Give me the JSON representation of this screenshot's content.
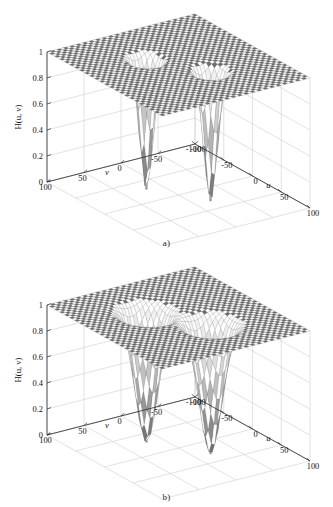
{
  "figure": {
    "panels": [
      {
        "id": "a",
        "caption": "a)",
        "zlabel": "H(u, v)",
        "xlabel": "u",
        "ylabel": "v",
        "z_ticks": [
          "0",
          "0.2",
          "0.4",
          "0.6",
          "0.8",
          "1"
        ],
        "u_ticks": [
          "-100",
          "-50",
          "0",
          "50",
          "100"
        ],
        "v_ticks": [
          "100",
          "50",
          "0",
          "-50",
          "-100"
        ]
      },
      {
        "id": "b",
        "caption": "b)",
        "zlabel": "H(u, v)",
        "xlabel": "u",
        "ylabel": "v",
        "z_ticks": [
          "0",
          "0.2",
          "0.4",
          "0.6",
          "0.8",
          "1"
        ],
        "u_ticks": [
          "-100",
          "-50",
          "0",
          "50",
          "100"
        ],
        "v_ticks": [
          "100",
          "50",
          "0",
          "-50",
          "-100"
        ]
      }
    ]
  },
  "chart_data": [
    {
      "type": "surface",
      "title": "",
      "panel": "a",
      "xlabel": "u",
      "ylabel": "v",
      "zlabel": "H(u, v)",
      "xlim": [
        -100,
        100
      ],
      "ylim": [
        -100,
        100
      ],
      "zlim": [
        0,
        1
      ],
      "xticks": [
        -100,
        -50,
        0,
        50,
        100
      ],
      "yticks": [
        100,
        50,
        0,
        -50,
        -100
      ],
      "zticks": [
        0,
        0.2,
        0.4,
        0.6,
        0.8,
        1
      ],
      "grid": true,
      "legend": "none",
      "baseline_value": 1,
      "description": "Notch reject filter transfer function: flat surface at H=1 with two symmetric notch depressions and two narrow spikes dropping to H=0",
      "notches": [
        {
          "u": -30,
          "v": 20,
          "depth_to": 0.0,
          "crater_radius": 12
        },
        {
          "u": 30,
          "v": -20,
          "depth_to": 0.0,
          "crater_radius": 12
        }
      ],
      "spikes": [
        {
          "u": -30,
          "v": 20,
          "z_from": 1.0,
          "z_to": 0.0
        },
        {
          "u": 30,
          "v": -20,
          "z_from": 1.0,
          "z_to": 0.0
        }
      ]
    },
    {
      "type": "surface",
      "title": "",
      "panel": "b",
      "xlabel": "u",
      "ylabel": "v",
      "zlabel": "H(u, v)",
      "xlim": [
        -100,
        100
      ],
      "ylim": [
        -100,
        100
      ],
      "zlim": [
        0,
        1
      ],
      "xticks": [
        -100,
        -50,
        0,
        50,
        100
      ],
      "yticks": [
        100,
        50,
        0,
        -50,
        -100
      ],
      "zticks": [
        0,
        0.2,
        0.4,
        0.6,
        0.8,
        1
      ],
      "grid": true,
      "legend": "none",
      "baseline_value": 1,
      "description": "Notch reject filter transfer function with wider notch craters: flat surface at H=1 with two symmetric broad notch depressions and two narrow spikes dropping to H=0",
      "notches": [
        {
          "u": -30,
          "v": 20,
          "depth_to": 0.0,
          "crater_radius": 20
        },
        {
          "u": 30,
          "v": -20,
          "depth_to": 0.0,
          "crater_radius": 20
        }
      ],
      "spikes": [
        {
          "u": -30,
          "v": 20,
          "z_from": 1.0,
          "z_to": 0.0
        },
        {
          "u": 30,
          "v": -20,
          "z_from": 1.0,
          "z_to": 0.0
        }
      ]
    }
  ]
}
